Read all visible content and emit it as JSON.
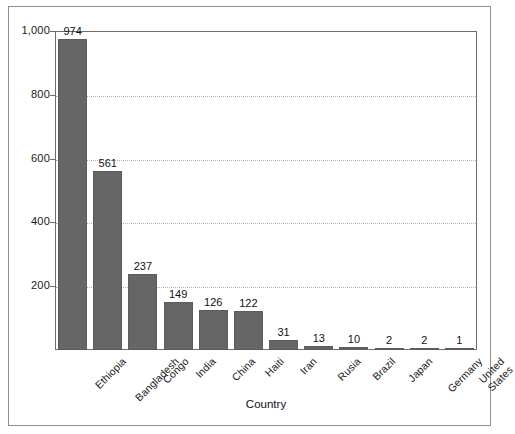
{
  "chart_data": {
    "type": "bar",
    "title": "",
    "xlabel": "Country",
    "ylabel": "",
    "categories": [
      "Ethiopia",
      "Bangladesh",
      "Congo",
      "India",
      "China",
      "Haiti",
      "Iran",
      "Rusia",
      "Brazil",
      "Japan",
      "Germany",
      "United\nStates"
    ],
    "values": [
      974,
      561,
      237,
      149,
      126,
      122,
      31,
      13,
      10,
      2,
      2,
      1
    ],
    "value_labels": [
      "974",
      "561",
      "237",
      "149",
      "126",
      "122",
      "31",
      "13",
      "10",
      "2",
      "2",
      "1"
    ],
    "ylim": [
      0,
      1000
    ],
    "yticks": [
      200,
      400,
      600,
      800,
      1000
    ],
    "ytick_labels": [
      "200",
      "400",
      "600",
      "800",
      "1,000"
    ],
    "grid": true,
    "legend": null,
    "bar_color": "#666666",
    "gridline_color": "#b0b0b0",
    "axis_color": "#6e6e6e",
    "frame_color": "#8f8f8f",
    "text_color": "#1a1a1a"
  }
}
